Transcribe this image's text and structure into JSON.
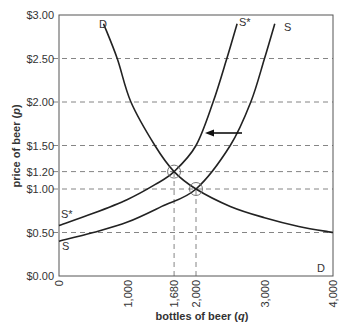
{
  "chart_data": {
    "type": "line",
    "title": "",
    "xlabel": "bottles of beer (q)",
    "ylabel": "price of beer (p)",
    "xlim": [
      0,
      4000
    ],
    "ylim": [
      0,
      3.0
    ],
    "x_ticks": [
      "0",
      "1,000",
      "1,680",
      "2,000",
      "3,000",
      "4,000"
    ],
    "x_tick_values": [
      0,
      1000,
      1680,
      2000,
      3000,
      4000
    ],
    "y_ticks": [
      "$0.00",
      "$0.50",
      "$1.00",
      "$1.20",
      "$1.50",
      "$2.00",
      "$2.50",
      "$3.00"
    ],
    "y_tick_values": [
      0,
      0.5,
      1.0,
      1.2,
      1.5,
      2.0,
      2.5,
      3.0
    ],
    "grid": "dashed horizontal lines at price ticks",
    "series": [
      {
        "name": "D",
        "label_top": "D",
        "label_bottom": "D",
        "points": [
          [
            650,
            2.9
          ],
          [
            850,
            2.5
          ],
          [
            1050,
            2.0
          ],
          [
            1400,
            1.5
          ],
          [
            1680,
            1.2
          ],
          [
            2000,
            1.0
          ],
          [
            2500,
            0.8
          ],
          [
            3000,
            0.67
          ],
          [
            3500,
            0.57
          ],
          [
            4000,
            0.5
          ]
        ]
      },
      {
        "name": "S",
        "label_top": "S",
        "label_bottom": "S",
        "points": [
          [
            0,
            0.4
          ],
          [
            500,
            0.5
          ],
          [
            1000,
            0.62
          ],
          [
            1500,
            0.8
          ],
          [
            2000,
            1.0
          ],
          [
            2500,
            1.5
          ],
          [
            2800,
            2.0
          ],
          [
            3000,
            2.5
          ],
          [
            3150,
            2.9
          ]
        ]
      },
      {
        "name": "S*",
        "label_top": "S*",
        "label_bottom": "S*",
        "points": [
          [
            0,
            0.58
          ],
          [
            500,
            0.72
          ],
          [
            1000,
            0.88
          ],
          [
            1400,
            1.05
          ],
          [
            1680,
            1.2
          ],
          [
            2000,
            1.5
          ],
          [
            2250,
            2.0
          ],
          [
            2450,
            2.5
          ],
          [
            2600,
            2.9
          ]
        ]
      }
    ],
    "annotations": [
      {
        "type": "equilibrium",
        "x": 1680,
        "y": 1.2,
        "marker": "circle"
      },
      {
        "type": "equilibrium",
        "x": 2000,
        "y": 1.0,
        "marker": "circle"
      },
      {
        "type": "arrow",
        "from": [
          2420,
          1.65
        ],
        "to": [
          2030,
          1.65
        ],
        "meaning": "supply shifts left from S to S*"
      },
      {
        "type": "dashed-vertical",
        "x": 1680,
        "from_y": 0,
        "to_y": 1.2
      },
      {
        "type": "dashed-vertical",
        "x": 2000,
        "from_y": 0,
        "to_y": 1.0
      }
    ]
  },
  "labels": {
    "xlabel_main": "bottles of beer (",
    "xlabel_var": "q",
    "xlabel_end": ")",
    "ylabel_main": "price of beer (",
    "ylabel_var": "p",
    "ylabel_end": ")",
    "d_top": "D",
    "d_bottom": "D",
    "s_top": "S",
    "s_bottom": "S",
    "sstar_top": "S*",
    "sstar_bottom": "S*"
  }
}
